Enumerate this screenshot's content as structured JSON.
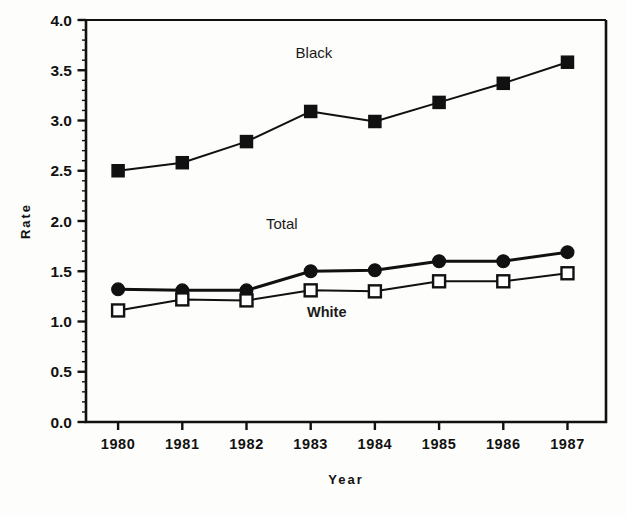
{
  "chart_data": {
    "type": "line",
    "title": "",
    "xlabel": "Year",
    "ylabel": "Rate",
    "categories": [
      "1980",
      "1981",
      "1982",
      "1983",
      "1984",
      "1985",
      "1986",
      "1987"
    ],
    "x": [
      1980,
      1981,
      1982,
      1983,
      1984,
      1985,
      1986,
      1987
    ],
    "xlim": [
      1979.5,
      1987.6
    ],
    "ylim": [
      0.0,
      4.0
    ],
    "y_ticks": [
      "0.0",
      "0.5",
      "1.0",
      "1.5",
      "2.0",
      "2.5",
      "3.0",
      "3.5",
      "4.0"
    ],
    "y_tick_values": [
      0.0,
      0.5,
      1.0,
      1.5,
      2.0,
      2.5,
      3.0,
      3.5,
      4.0
    ],
    "y_minor_tick_step": 0.1,
    "grid": false,
    "legend": "inline-labels",
    "series": [
      {
        "name": "Black",
        "marker": "filled-square",
        "color": "#111111",
        "label_x": 1983.05,
        "label_y": 3.62,
        "values": [
          2.5,
          2.58,
          2.79,
          3.09,
          2.99,
          3.18,
          3.37,
          3.58
        ]
      },
      {
        "name": "Total",
        "marker": "filled-circle",
        "color": "#111111",
        "label_x": 1982.55,
        "label_y": 1.92,
        "values": [
          1.32,
          1.31,
          1.31,
          1.5,
          1.51,
          1.6,
          1.6,
          1.69
        ]
      },
      {
        "name": "White",
        "marker": "open-square",
        "color": "#111111",
        "label_x": 1983.25,
        "label_y": 1.04,
        "values": [
          1.11,
          1.22,
          1.21,
          1.31,
          1.3,
          1.4,
          1.4,
          1.48
        ]
      }
    ]
  }
}
